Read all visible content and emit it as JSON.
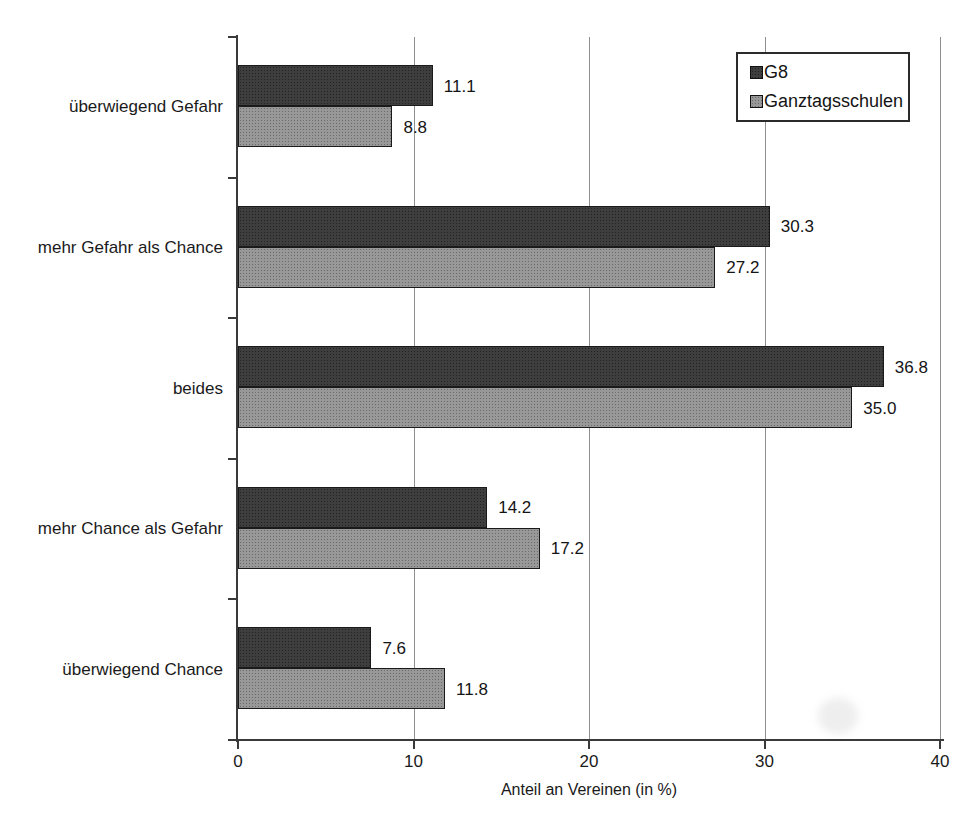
{
  "chart_data": {
    "type": "bar",
    "orientation": "horizontal",
    "title": "",
    "xlabel": "Anteil an Vereinen (in %)",
    "ylabel": "",
    "xlim": [
      0,
      40
    ],
    "xticks": [
      0,
      10,
      20,
      30,
      40
    ],
    "xtick_labels": [
      "0",
      "10",
      "20",
      "30",
      "40"
    ],
    "grid": "vertical",
    "legend_position": "top-right",
    "categories": [
      "überwiegend Gefahr",
      "mehr Gefahr als Chance",
      "beides",
      "mehr Chance als Gefahr",
      "überwiegend Chance"
    ],
    "series": [
      {
        "name": "G8",
        "color": "#3e3e3e",
        "values": [
          11.1,
          30.3,
          36.8,
          14.2,
          7.6
        ]
      },
      {
        "name": "Ganztagsschulen",
        "color": "#989898",
        "values": [
          8.8,
          27.2,
          35.0,
          17.2,
          11.8
        ]
      }
    ],
    "value_labels": [
      [
        "11.1",
        "30.3",
        "36.8",
        "14.2",
        "7.6"
      ],
      [
        "8.8",
        "27.2",
        "35.0",
        "17.2",
        "11.8"
      ]
    ]
  },
  "colors": {
    "axis": "#3a3a3a",
    "gridline": "#8f8f8f",
    "series_g8": "#3e3e3e",
    "series_ganztagsschulen": "#989898",
    "background": "#ffffff"
  }
}
